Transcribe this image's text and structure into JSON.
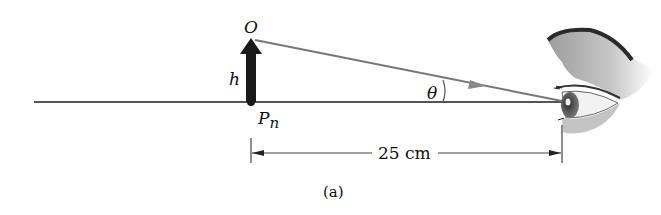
{
  "diagram": {
    "labels": {
      "object_point": "O",
      "height": "h",
      "near_point": "P",
      "near_point_sub": "n",
      "angle": "θ",
      "distance": "25 cm",
      "caption": "(a)"
    },
    "colors": {
      "axis_line": "#555555",
      "arrow_fill": "#1a1a1a",
      "ray": "#777777",
      "ray_arrowhead": "#888888",
      "text": "#111111",
      "eye_skin": "#b8b8b8",
      "brow": "#2a2a2a"
    },
    "elements": {
      "optical_axis": "horizontal line",
      "object_arrow": "vertical thick arrow of height h at near point",
      "ray": "line from O to eye",
      "eye": "side-view human eye"
    }
  }
}
